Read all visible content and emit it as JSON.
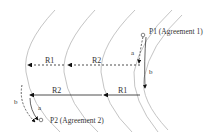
{
  "diagram": {
    "points": [
      {
        "id": "P1",
        "label": "P1 (Agreement 1)"
      },
      {
        "id": "P2",
        "label": "P2 (Agreement 2)"
      }
    ],
    "ranges_top": [
      {
        "label": "R1",
        "style": "dashed"
      },
      {
        "label": "R2",
        "style": "dashed"
      }
    ],
    "ranges_bottom": [
      {
        "label": "R2",
        "style": "solid"
      },
      {
        "label": "R1",
        "style": "solid"
      }
    ],
    "path_labels": {
      "p1_a": "a",
      "p1_b": "b",
      "p2_a": "a",
      "p2_b": "b"
    },
    "colors": {
      "arc": "#b0b0b0",
      "line": "#222222",
      "text": "#333333"
    }
  }
}
